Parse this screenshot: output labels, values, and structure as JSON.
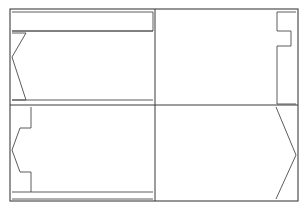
{
  "figure": {
    "background_color": "#ffffff",
    "line_color": "#3a3a3a",
    "line_width": 1,
    "canvas": {
      "width": 308,
      "height": 211
    }
  },
  "frame": {
    "name": "outer-rectangle",
    "x": 10,
    "y": 9,
    "width": 288,
    "height": 192
  },
  "dividers": {
    "vertical": {
      "name": "center-vertical-divider",
      "x": 155,
      "y1": 9,
      "y2": 201
    },
    "horizontal": {
      "name": "center-horizontal-divider",
      "x1": 10,
      "y1": 105,
      "x2": 298,
      "y2": 105
    }
  },
  "panels": [
    {
      "id": "top-left",
      "name": "panel-top-left",
      "label": "Top left panel",
      "profile": "v-notch",
      "bounds": {
        "x": 10,
        "y": 9,
        "width": 145,
        "height": 96
      },
      "strip": {
        "name": "top-strip",
        "points": "12,12 153,12 153,31 12,31"
      },
      "profile_points": "12,33 26,33 12,57 26,100 12,100",
      "inner_line": {
        "x1": 12,
        "y1": 100,
        "x2": 153,
        "y2": 100
      }
    },
    {
      "id": "top-right",
      "name": "panel-top-right",
      "label": "Top right panel",
      "profile": "rectangular-step-tab",
      "bounds": {
        "x": 155,
        "y": 9,
        "width": 143,
        "height": 96
      },
      "profile_points": "296,12 277,12 277,31 291,31 291,46 277,46 277,104 296,104"
    },
    {
      "id": "bottom-left",
      "name": "panel-bottom-left",
      "label": "Bottom left panel",
      "profile": "stepped-chevron",
      "bounds": {
        "x": 10,
        "y": 105,
        "width": 145,
        "height": 96
      },
      "profile_points": "31,107 31,128 20,128 12,150 20,172 31,172 31,192",
      "strip": {
        "name": "bottom-strip",
        "points": "12,192 153,192 153,199 12,199"
      },
      "inner_line": {
        "x1": 31,
        "y1": 192,
        "x2": 153,
        "y2": 192
      }
    },
    {
      "id": "bottom-right",
      "name": "panel-bottom-right",
      "label": "Bottom right panel",
      "profile": "pointed-chevron",
      "bounds": {
        "x": 155,
        "y": 105,
        "width": 143,
        "height": 96
      },
      "profile_points": "276,107 296,155 276,199"
    }
  ]
}
